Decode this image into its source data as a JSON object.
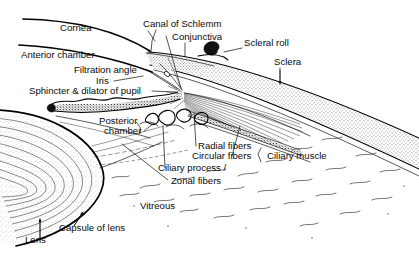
{
  "figure": {
    "background_color": "#ffffff",
    "ink_color": "#0a0a0a",
    "width": 419,
    "height": 254
  },
  "labels": [
    {
      "id": "cornea",
      "text": "Cornea",
      "x": 60,
      "y": 31,
      "align": "start"
    },
    {
      "id": "canal_of_schlemm",
      "text": "Canal of Schlemm",
      "x": 143,
      "y": 27,
      "align": "start"
    },
    {
      "id": "conjunctiva",
      "text": "Conjunctiva",
      "x": 172,
      "y": 40,
      "align": "start"
    },
    {
      "id": "scleral_roll",
      "text": "Scleral roll",
      "x": 244,
      "y": 46,
      "align": "start"
    },
    {
      "id": "sclera",
      "text": "Sclera",
      "x": 274,
      "y": 65,
      "align": "start"
    },
    {
      "id": "anterior_chamber",
      "text": "Anterior chamber",
      "x": 21,
      "y": 58,
      "align": "start"
    },
    {
      "id": "filtration_angle",
      "text": "Filtration angle",
      "x": 74,
      "y": 73,
      "align": "start"
    },
    {
      "id": "iris",
      "text": "Iris",
      "x": 96,
      "y": 84,
      "align": "start"
    },
    {
      "id": "sphincter_dilator",
      "text": "Sphincter & dilator of pupil",
      "x": 29,
      "y": 94,
      "align": "start"
    },
    {
      "id": "posterior_chamber_l1",
      "text": "Posterior",
      "x": 99,
      "y": 124,
      "align": "start"
    },
    {
      "id": "posterior_chamber_l2",
      "text": "chamber",
      "x": 104,
      "y": 134,
      "align": "start"
    },
    {
      "id": "radial_fibers",
      "text": "Radial fibers",
      "x": 198,
      "y": 149,
      "align": "start"
    },
    {
      "id": "circular_fibers",
      "text": "Circular fibers",
      "x": 192,
      "y": 159,
      "align": "start"
    },
    {
      "id": "ciliary_muscle",
      "text": "Ciliary muscle",
      "x": 267,
      "y": 159,
      "align": "start"
    },
    {
      "id": "ciliary_process",
      "text": "Ciliary process /",
      "x": 158,
      "y": 171,
      "align": "start"
    },
    {
      "id": "zonal_fibers",
      "text": "Zonal fibers",
      "x": 171,
      "y": 184,
      "align": "start"
    },
    {
      "id": "vitreous",
      "text": "Vitreous",
      "x": 140,
      "y": 209,
      "align": "start"
    },
    {
      "id": "capsule_of_lens",
      "text": "Capsule of lens",
      "x": 59,
      "y": 231,
      "align": "start"
    },
    {
      "id": "lens",
      "text": "Lens",
      "x": 25,
      "y": 243,
      "align": "start"
    }
  ],
  "leader_lines": [
    {
      "id": "leader-canal-of-schlemm",
      "path": "M 156 30 L 152 41 L 151 52"
    },
    {
      "id": "leader-canal-tick",
      "path": "M 148 31 L 155 41"
    },
    {
      "id": "leader-conjunctiva",
      "path": "M 185 43 L 185 56"
    },
    {
      "id": "leader-scleral-roll",
      "path": "M 242 48 L 224 52"
    },
    {
      "id": "leader-sclera",
      "path": "M 280 68 L 280 82"
    },
    {
      "id": "leader-filtration-angle",
      "path": "M 147 70 L 177 89"
    },
    {
      "id": "leader-iris",
      "path": "M 114 81 L 143 76"
    },
    {
      "id": "leader-sphincter",
      "path": "M 152 91 L 176 92"
    },
    {
      "id": "leader-schlemm-to-angle",
      "path": "M 166 36 L 181 88"
    },
    {
      "id": "leader-posterior-chamber",
      "path": "M 144 131 L 154 123"
    },
    {
      "id": "leader-radial-fibers",
      "path": "M 196 146 L 194 113"
    },
    {
      "id": "leader-circular-fibers",
      "path": "M 232 156 L 240 126"
    },
    {
      "id": "leader-ciliary-process",
      "path": "M 165 168 L 163 126"
    },
    {
      "id": "leader-zonal-fibers",
      "path": "M 168 180 L 122 144"
    },
    {
      "id": "leader-capsule-of-lens",
      "path": "M 74 226 L 82 213"
    },
    {
      "id": "leader-lens",
      "path": "M 40 240 L 40 219"
    },
    {
      "id": "brace-ciliary-muscle",
      "path": "M 261 148 L 258 154 L 261 162"
    }
  ],
  "arrow_heads": [
    {
      "id": "arrow-sclera",
      "x": 280,
      "y": 83,
      "angle": 90
    },
    {
      "id": "arrow-lens",
      "x": 40,
      "y": 218,
      "angle": -90
    },
    {
      "id": "arrow-capsule",
      "x": 83,
      "y": 212,
      "angle": -55
    }
  ],
  "structures": [
    {
      "id": "cornea-outer-surface",
      "label": "Cornea outer surface"
    },
    {
      "id": "cornea-inner-surface",
      "label": "Cornea inner surface"
    },
    {
      "id": "sclera-band",
      "label": "Sclera"
    },
    {
      "id": "scleral-roll-curl",
      "label": "Scleral roll"
    },
    {
      "id": "iris-body",
      "label": "Iris"
    },
    {
      "id": "ciliary-body",
      "label": "Ciliary body and muscle fibers"
    },
    {
      "id": "ciliary-processes",
      "label": "Ciliary processes"
    },
    {
      "id": "lens-body",
      "label": "Lens with concentric lamellae"
    },
    {
      "id": "lens-capsule-line",
      "label": "Capsule of lens"
    },
    {
      "id": "vitreous-field",
      "label": "Vitreous"
    },
    {
      "id": "zonule-fibers",
      "label": "Zonal fibers"
    }
  ]
}
